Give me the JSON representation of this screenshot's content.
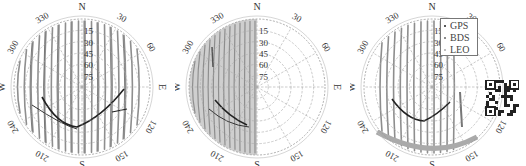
{
  "chart_data": [
    {
      "type": "polar-skyplot",
      "panel": "left",
      "title": "",
      "radial_ticks": [
        "15",
        "30",
        "45",
        "60",
        "75"
      ],
      "azimuth_ticks": [
        "N",
        "30",
        "60",
        "E",
        "120",
        "150",
        "S",
        "210",
        "240",
        "W",
        "300",
        "330"
      ],
      "series": [
        {
          "name": "GPS",
          "color": "#222222",
          "description": "dark satellite arcs in lower half forming V shape and near E side"
        },
        {
          "name": "BDS",
          "color": "#666666",
          "description": "medium-gray tracks"
        },
        {
          "name": "LEO",
          "color": "#9a9a9a",
          "description": "dense near-vertical gray tracks covering most of sky"
        }
      ],
      "grid": true
    },
    {
      "type": "polar-skyplot",
      "panel": "middle",
      "title": "",
      "radial_ticks": [
        "15",
        "30",
        "45",
        "60",
        "75"
      ],
      "azimuth_ticks": [
        "N",
        "30",
        "60",
        "E",
        "120",
        "150",
        "S",
        "210",
        "240",
        "W",
        "300",
        "330"
      ],
      "series": [
        {
          "name": "GPS",
          "color": "#222222",
          "description": "dark arcs left-lower quadrant"
        },
        {
          "name": "BDS",
          "color": "#666666",
          "description": "tracks on western half"
        },
        {
          "name": "LEO",
          "color": "#9a9a9a",
          "description": "dense tracks concentrated on western half only"
        }
      ],
      "grid": true
    },
    {
      "type": "polar-skyplot",
      "panel": "right",
      "title": "",
      "radial_ticks": [
        "15",
        "30",
        "45",
        "60",
        "75"
      ],
      "azimuth_ticks": [
        "N",
        "30",
        "60",
        "E",
        "120",
        "150",
        "S",
        "210",
        "240",
        "W",
        "300",
        "330"
      ],
      "series": [
        {
          "name": "GPS",
          "color": "#222222",
          "description": "dark V-shaped arcs lower center"
        },
        {
          "name": "BDS",
          "color": "#666666",
          "description": "tracks central band"
        },
        {
          "name": "LEO",
          "color": "#9a9a9a",
          "description": "tracks concentrated in central vertical band and south"
        }
      ],
      "grid": true
    }
  ],
  "legend": {
    "items": [
      {
        "label": "GPS",
        "color": "#222222"
      },
      {
        "label": "BDS",
        "color": "#666666"
      },
      {
        "label": "LEO",
        "color": "#9a9a9a"
      }
    ]
  },
  "plots": {
    "radial": [
      "15",
      "30",
      "45",
      "60",
      "75"
    ],
    "azimuth": {
      "n": "N",
      "a30": "30",
      "a60": "60",
      "e": "E",
      "a120": "120",
      "a150": "150",
      "s": "S",
      "a210": "210",
      "a240": "240",
      "w": "W",
      "a300": "300",
      "a330": "330"
    }
  },
  "qr_code": {
    "label": "qr-code"
  }
}
